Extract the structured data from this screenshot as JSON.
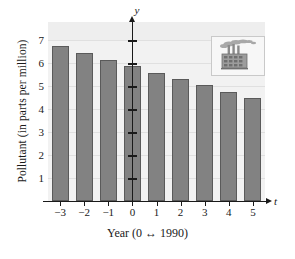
{
  "chart_data": {
    "type": "bar",
    "title": "",
    "xlabel": "Year (0 ↔ 1990)",
    "ylabel": "Pollutant (in parts per million)",
    "x_axis_name": "t",
    "y_axis_name": "y",
    "categories": [
      "-3",
      "-2",
      "-1",
      "0",
      "1",
      "2",
      "3",
      "4",
      "5"
    ],
    "x": [
      -3,
      -2,
      -1,
      0,
      1,
      2,
      3,
      4,
      5
    ],
    "values": [
      6.75,
      6.45,
      6.15,
      5.9,
      5.6,
      5.3,
      5.05,
      4.77,
      4.5
    ],
    "ylim": [
      0,
      7.8
    ],
    "xlim": [
      -3.7,
      5.8
    ],
    "yticks": [
      1,
      2,
      3,
      4,
      5,
      6,
      7
    ],
    "ytick_labels": [
      "1",
      "2",
      "3",
      "4",
      "5",
      "6",
      "7"
    ],
    "xtick_labels": [
      "−3",
      "−2",
      "−1",
      "0",
      "1",
      "2",
      "3",
      "4",
      "5"
    ],
    "grid": true,
    "legend": null,
    "bar_color": "#828282",
    "bar_border_color": "#5a5a5a",
    "plot_background": "#f2f2f2",
    "gridline_color": "#e0e0e0",
    "axis_color": "#1a1a1a",
    "annotations": [
      {
        "name": "factory-icon-inset",
        "description": "factory with smokestacks emitting smoke"
      }
    ]
  }
}
